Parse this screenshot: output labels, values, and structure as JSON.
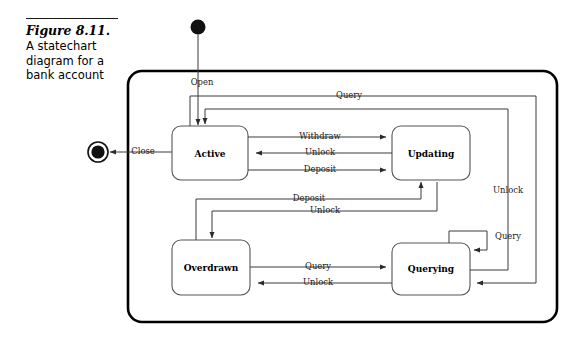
{
  "figure": {
    "number": "Figure 8.11.",
    "caption": "A statechart diagram for a bank account"
  },
  "diagram": {
    "type": "uml-statechart",
    "colors": {
      "border": "#000000",
      "state_stroke": "#555555",
      "edge": "#3a3a3a",
      "node_fill": "#ffffff",
      "background": "#ffffff"
    },
    "pseudostates": [
      {
        "name": "initial-state",
        "kind": "initial"
      },
      {
        "name": "final-state",
        "kind": "final"
      }
    ],
    "states": [
      {
        "id": "active",
        "label": "Active"
      },
      {
        "id": "updating",
        "label": "Updating"
      },
      {
        "id": "overdrawn",
        "label": "Overdrawn"
      },
      {
        "id": "querying",
        "label": "Querying"
      }
    ],
    "transitions": [
      {
        "from": "initial",
        "to": "active",
        "label": "Open"
      },
      {
        "from": "active",
        "to": "final",
        "label": "Close"
      },
      {
        "from": "active",
        "to": "updating",
        "label": "Withdraw"
      },
      {
        "from": "updating",
        "to": "active",
        "label": "Unlock"
      },
      {
        "from": "active",
        "to": "updating",
        "label": "Deposit"
      },
      {
        "from": "active",
        "to": "querying",
        "label": "Query"
      },
      {
        "from": "querying",
        "to": "active",
        "label": "Unlock"
      },
      {
        "from": "overdrawn",
        "to": "updating",
        "label": "Deposit"
      },
      {
        "from": "updating",
        "to": "overdrawn",
        "label": "Unlock"
      },
      {
        "from": "overdrawn",
        "to": "querying",
        "label": "Query"
      },
      {
        "from": "querying",
        "to": "overdrawn",
        "label": "Unlock"
      },
      {
        "from": "querying",
        "to": "querying",
        "label": "Query"
      }
    ],
    "labels": {
      "open": "Open",
      "close": "Close",
      "withdraw": "Withdraw",
      "unlock_updating_active": "Unlock",
      "deposit_active_updating": "Deposit",
      "query_top": "Query",
      "unlock_right": "Unlock",
      "deposit_overdrawn_updating": "Deposit",
      "unlock_updating_overdrawn": "Unlock",
      "query_overdrawn_querying": "Query",
      "unlock_querying_overdrawn": "Unlock",
      "query_self": "Query"
    }
  }
}
